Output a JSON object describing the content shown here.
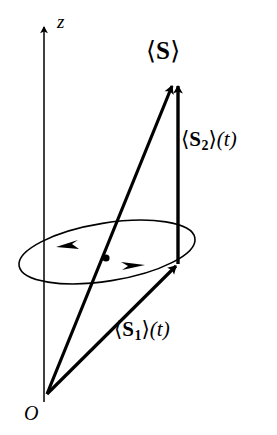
{
  "figure": {
    "background_color": "#ffffff",
    "stroke_color": "#000000",
    "width": 277,
    "height": 435
  },
  "axis": {
    "name": "z-axis",
    "label": "z",
    "label_style": "italic",
    "x": 44,
    "top_y": 18,
    "bottom_y": 400,
    "arrow_at": "top"
  },
  "origin": {
    "label": "O",
    "label_style": "italic",
    "x": 47,
    "y": 395
  },
  "vectors": [
    {
      "id": "S",
      "name": "mean-spin-vector",
      "label_angle_open": "⟨",
      "label_symbol": "S",
      "label_angle_close": "⟩",
      "label_time": "",
      "label_full": "⟨ S ⟩",
      "from_x": 47,
      "from_y": 395,
      "to_x": 176,
      "to_y": 77,
      "thickness": 3.2,
      "arrow": "end"
    },
    {
      "id": "S1",
      "name": "spin-component-1-vector",
      "label_angle_open": "⟨",
      "label_symbol": "S",
      "label_subscript": "1",
      "label_angle_close": "⟩",
      "label_time": "(t)",
      "label_full": "⟨ S₁ ⟩(t)",
      "from_x": 47,
      "from_y": 395,
      "to_x": 181,
      "to_y": 262,
      "thickness": 3.2,
      "arrow": "end"
    },
    {
      "id": "S2",
      "name": "spin-component-2-vector",
      "label_angle_open": "⟨",
      "label_symbol": "S",
      "label_subscript": "2",
      "label_angle_close": "⟩",
      "label_time": "(t)",
      "label_full": "⟨ S₂ ⟩(t)",
      "from_x": 178,
      "from_y": 263,
      "to_x": 178,
      "to_y": 77,
      "thickness": 3.4,
      "arrow": "end"
    }
  ],
  "precession_orbit": {
    "name": "precession-ellipse",
    "center_x": 107,
    "center_y": 252,
    "radius_x": 89,
    "radius_y": 28,
    "rotation_deg": -9,
    "stroke_width": 1.5,
    "direction_markers": [
      {
        "name": "orbit-arrow-left",
        "points": "left"
      },
      {
        "name": "orbit-arrow-right",
        "points": "right"
      }
    ],
    "point_marker": {
      "name": "orbit-point-dot",
      "x": 106,
      "y": 258
    }
  }
}
